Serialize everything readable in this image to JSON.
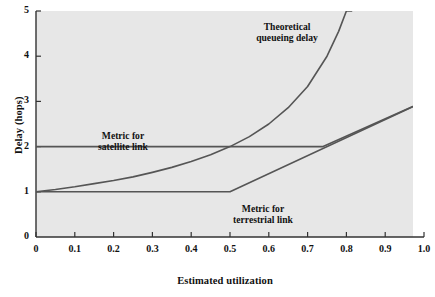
{
  "chart_data": {
    "type": "line",
    "title": "",
    "xlabel": "Estimated utilization",
    "ylabel": "Delay (hops)",
    "xlim": [
      0,
      1.0
    ],
    "ylim": [
      0,
      5
    ],
    "grid": false,
    "legend_position": "inline-annotations",
    "background_color": "#e7e7e7",
    "line_color": "#555555",
    "axis_color": "#333333",
    "xticks": [
      "0",
      "0.1",
      "0.2",
      "0.3",
      "0.4",
      "0.5",
      "0.6",
      "0.7",
      "0.8",
      "0.9",
      "1.0"
    ],
    "xtick_values": [
      0,
      0.1,
      0.2,
      0.3,
      0.4,
      0.5,
      0.6,
      0.7,
      0.8,
      0.9,
      1.0
    ],
    "yticks": [
      "0",
      "1",
      "2",
      "3",
      "4",
      "5"
    ],
    "ytick_values": [
      0,
      1,
      2,
      3,
      4,
      5
    ],
    "series": [
      {
        "name": "Theoretical queueing delay",
        "annotation": "Theoretical\nqueueing delay",
        "annotation_line1": "Theoretical",
        "annotation_line2": "queueing delay",
        "x": [
          0.0,
          0.05,
          0.1,
          0.15,
          0.2,
          0.25,
          0.3,
          0.35,
          0.4,
          0.45,
          0.5,
          0.55,
          0.6,
          0.65,
          0.7,
          0.75,
          0.78,
          0.8,
          0.815
        ],
        "values": [
          1.0,
          1.05,
          1.11,
          1.18,
          1.25,
          1.33,
          1.43,
          1.54,
          1.67,
          1.82,
          2.0,
          2.22,
          2.5,
          2.86,
          3.33,
          4.0,
          4.55,
          5.0,
          5.0
        ]
      },
      {
        "name": "Metric for satellite link",
        "annotation_line1": "Metric for",
        "annotation_line2": "satellite link",
        "x": [
          0.0,
          0.74,
          1.0
        ],
        "values": [
          2.0,
          2.0,
          3.0
        ]
      },
      {
        "name": "Metric for terrestrial link",
        "annotation_line1": "Metric for",
        "annotation_line2": "terrestrial link",
        "x": [
          0.0,
          0.5,
          1.0
        ],
        "values": [
          1.0,
          1.0,
          3.0
        ]
      }
    ]
  },
  "annotations": {
    "theoretical": {
      "line1": "Theoretical",
      "line2": "queueing delay"
    },
    "satellite": {
      "line1": "Metric for",
      "line2": "satellite link"
    },
    "terrestrial": {
      "line1": "Metric for",
      "line2": "terrestrial link"
    }
  },
  "axes": {
    "x_title": "Estimated utilization",
    "y_title": "Delay (hops)"
  }
}
